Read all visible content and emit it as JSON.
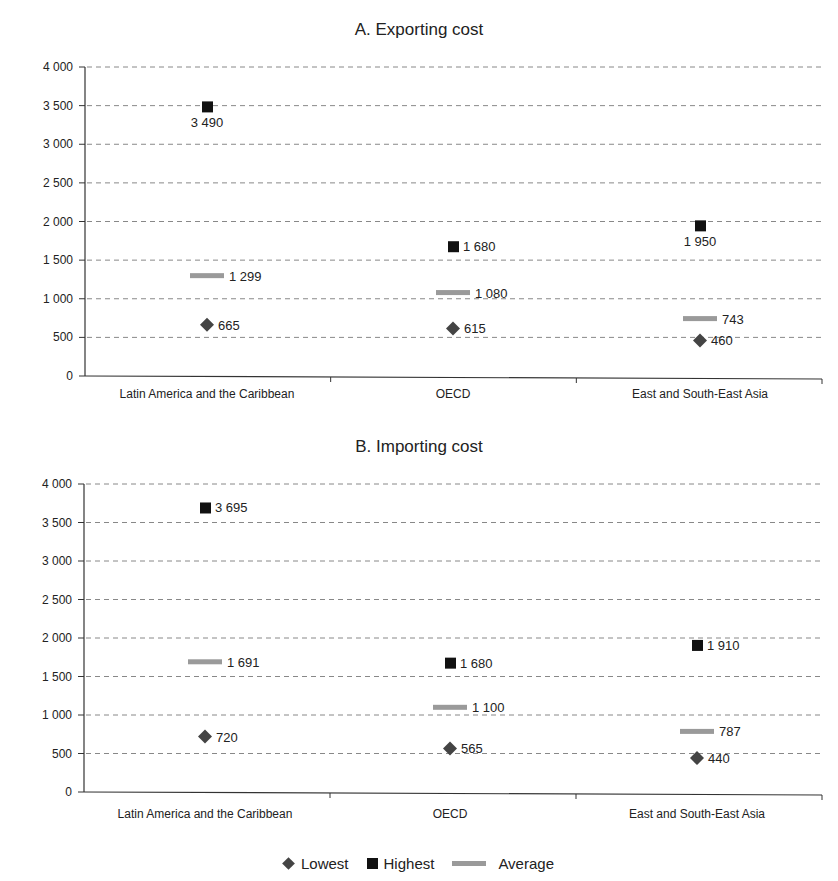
{
  "chart_data": [
    {
      "type": "scatter",
      "title": "A. Exporting cost",
      "xlabel": "",
      "ylabel": "",
      "categories": [
        "Latin America and the Caribbean",
        "OECD",
        "East and South-East Asia"
      ],
      "series": [
        {
          "name": "Lowest",
          "marker": "diamond",
          "color": "#444444",
          "values": [
            665,
            615,
            460
          ],
          "labels": [
            "665",
            "615",
            "460"
          ]
        },
        {
          "name": "Highest",
          "marker": "square",
          "color": "#111111",
          "values": [
            3490,
            1680,
            1950
          ],
          "labels": [
            "3 490",
            "1 680",
            "1 950"
          ]
        },
        {
          "name": "Average",
          "marker": "dash",
          "color": "#9a9a9a",
          "values": [
            1299,
            1080,
            743
          ],
          "labels": [
            "1 299",
            "1 080",
            "743"
          ]
        }
      ],
      "ylim": [
        0,
        4000
      ],
      "yticks": [
        0,
        500,
        1000,
        1500,
        2000,
        2500,
        3000,
        3500,
        4000
      ],
      "ytick_labels": [
        "0",
        "500",
        "1 000",
        "1 500",
        "2 000",
        "2 500",
        "3 000",
        "3 500",
        "4 000"
      ],
      "grid": "horizontal dashed"
    },
    {
      "type": "scatter",
      "title": "B. Importing cost",
      "xlabel": "",
      "ylabel": "",
      "categories": [
        "Latin America and the Caribbean",
        "OECD",
        "East and South-East Asia"
      ],
      "series": [
        {
          "name": "Lowest",
          "marker": "diamond",
          "color": "#444444",
          "values": [
            720,
            565,
            440
          ],
          "labels": [
            "720",
            "565",
            "440"
          ]
        },
        {
          "name": "Highest",
          "marker": "square",
          "color": "#111111",
          "values": [
            3695,
            1680,
            1910
          ],
          "labels": [
            "3 695",
            "1 680",
            "1 910"
          ]
        },
        {
          "name": "Average",
          "marker": "dash",
          "color": "#9a9a9a",
          "values": [
            1691,
            1100,
            787
          ],
          "labels": [
            "1 691",
            "1 100",
            "787"
          ]
        }
      ],
      "ylim": [
        0,
        4000
      ],
      "yticks": [
        0,
        500,
        1000,
        1500,
        2000,
        2500,
        3000,
        3500,
        4000
      ],
      "ytick_labels": [
        "0",
        "500",
        "1 000",
        "1 500",
        "2 000",
        "2 500",
        "3 000",
        "3 500",
        "4 000"
      ],
      "grid": "horizontal dashed"
    }
  ],
  "legend": {
    "position": "bottom",
    "items": [
      {
        "label": "Lowest",
        "icon": "diamond-icon"
      },
      {
        "label": "Highest",
        "icon": "square-icon"
      },
      {
        "label": "Average",
        "icon": "dash-icon"
      }
    ]
  }
}
